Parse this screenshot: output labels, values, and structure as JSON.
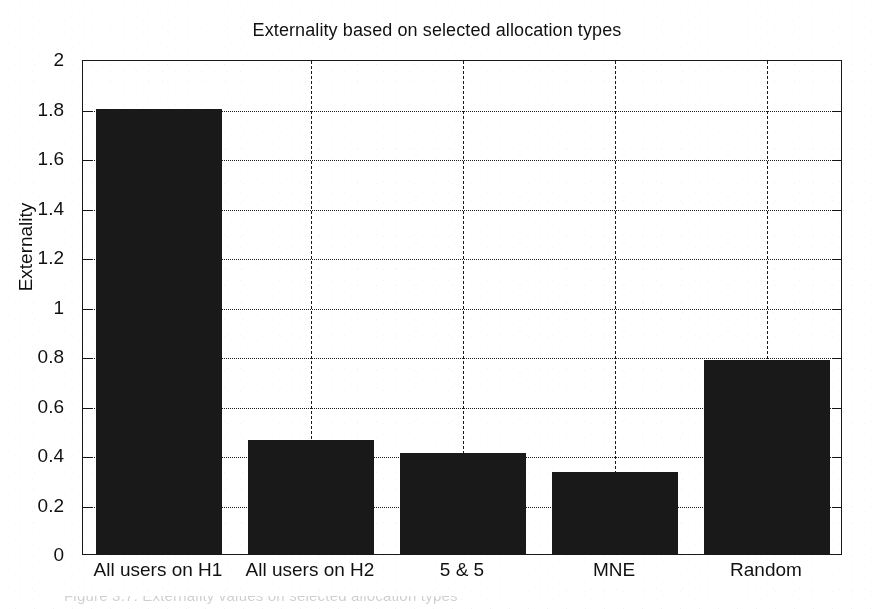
{
  "chart_data": {
    "type": "bar",
    "title": "Externality based on selected allocation types",
    "xlabel": "",
    "ylabel": "Externality",
    "categories": [
      "All users on H1",
      "All users on H2",
      "5 & 5",
      "MNE",
      "Random"
    ],
    "values": [
      1.8,
      0.46,
      0.41,
      0.33,
      0.785
    ],
    "ylim": [
      0,
      2
    ],
    "ytick_values": [
      0,
      0.2,
      0.4,
      0.6,
      0.8,
      1,
      1.2,
      1.4,
      1.6,
      1.8,
      2
    ],
    "ytick_labels": [
      "0",
      "0.2",
      "0.4",
      "0.6",
      "0.8",
      "1",
      "1.2",
      "1.4",
      "1.6",
      "1.8",
      "2"
    ],
    "grid": true,
    "grid_style": "dotted",
    "legend": null,
    "bar_color": "#1b1b1b",
    "axis_color": "#1a1a1a",
    "background": "#ffffff"
  },
  "figure": {
    "title": "Externality based on selected allocation types",
    "y_axis_title": "Externality",
    "caption_fragment": "Figure 3.7: Externality values on selected allocation types"
  }
}
